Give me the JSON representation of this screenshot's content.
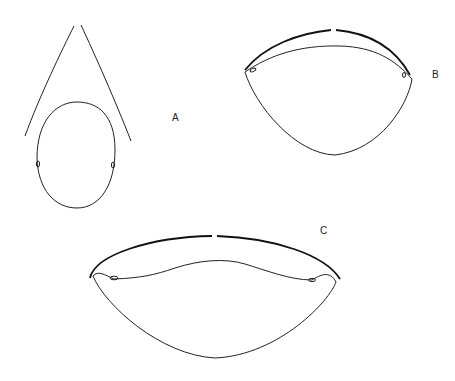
{
  "figure": {
    "labels": {
      "a": "A",
      "b": "B",
      "c": "C"
    },
    "colors": {
      "line": "#222222",
      "background": "#ffffff"
    },
    "parts": [
      {
        "id": "A",
        "description": "oval outline with two diverging lines above and small eye marks on sides"
      },
      {
        "id": "B",
        "description": "rounded triangular outline with split arc above and small eye marks at corners"
      },
      {
        "id": "C",
        "description": "wide lens-shaped outline with split arc above and small eye marks at corners"
      }
    ]
  }
}
